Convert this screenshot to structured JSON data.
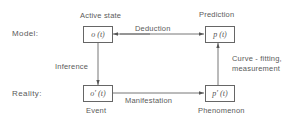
{
  "diagram": {
    "rows": {
      "model": "Model:",
      "reality": "Reality:"
    },
    "nodes": {
      "active_state": {
        "caption": "Active state",
        "symbol": "o (t)"
      },
      "prediction": {
        "caption": "Prediction",
        "symbol": "p (t)"
      },
      "event": {
        "caption": "Event",
        "symbol": "o' (t)"
      },
      "phenomenon": {
        "caption": "Phenomenon",
        "symbol": "p' (t)"
      }
    },
    "edges": {
      "deduction": "Deduction",
      "inference": "Inference",
      "manifestation": "Manifestation",
      "curve_fitting_line1": "Curve - fitting,",
      "curve_fitting_line2": "measurement"
    },
    "colors": {
      "stroke": "#666666",
      "text": "#5a5a5a"
    }
  }
}
